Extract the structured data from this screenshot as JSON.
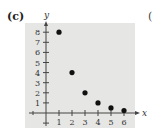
{
  "panel": {
    "label": "(c)",
    "next_label": "("
  },
  "colors": {
    "background": "#e6e6e4",
    "axis": "#444444",
    "point": "#111111"
  },
  "chart_data": {
    "type": "scatter",
    "title": "",
    "xlabel": "x",
    "ylabel": "y",
    "x": [
      1,
      2,
      3,
      4,
      5,
      6
    ],
    "y": [
      8,
      4,
      2,
      1,
      0.5,
      0.25
    ],
    "xticks": [
      1,
      2,
      3,
      4,
      5,
      6
    ],
    "yticks": [
      1,
      2,
      3,
      4,
      5,
      6,
      7,
      8
    ],
    "xlim": [
      -1,
      7
    ],
    "ylim": [
      -1,
      9
    ],
    "grid": false,
    "legend": null
  }
}
